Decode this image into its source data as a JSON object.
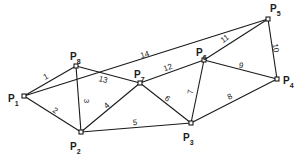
{
  "diagram": {
    "type": "network-graph",
    "nodes": [
      {
        "id": "P1",
        "letter": "P",
        "sub": "1",
        "x": 24,
        "y": 96,
        "lx": 8,
        "ly": 102
      },
      {
        "id": "P2",
        "letter": "P",
        "sub": "2",
        "x": 81,
        "y": 132,
        "lx": 70,
        "ly": 150
      },
      {
        "id": "P3",
        "letter": "P",
        "sub": "3",
        "x": 191,
        "y": 123,
        "lx": 183,
        "ly": 141
      },
      {
        "id": "P4",
        "letter": "P",
        "sub": "4",
        "x": 277,
        "y": 79,
        "lx": 283,
        "ly": 84
      },
      {
        "id": "P5",
        "letter": "P",
        "sub": "5",
        "x": 268,
        "y": 19,
        "lx": 270,
        "ly": 12
      },
      {
        "id": "P6",
        "letter": "P",
        "sub": "6",
        "x": 204,
        "y": 60,
        "lx": 196,
        "ly": 56
      },
      {
        "id": "P7",
        "letter": "P",
        "sub": "7",
        "x": 140,
        "y": 83,
        "lx": 134,
        "ly": 78
      },
      {
        "id": "P8",
        "letter": "P",
        "sub": "8",
        "x": 76,
        "y": 66,
        "lx": 70,
        "ly": 60
      }
    ],
    "edges": [
      {
        "label": "1",
        "from": "P1",
        "to": "P8",
        "lx": 46,
        "ly": 77,
        "rot": -28
      },
      {
        "label": "2",
        "from": "P1",
        "to": "P2",
        "lx": 55,
        "ly": 111,
        "rot": 32
      },
      {
        "label": "3",
        "from": "P8",
        "to": "P2",
        "lx": 86,
        "ly": 101,
        "rot": 90
      },
      {
        "label": "4",
        "from": "P2",
        "to": "P7",
        "lx": 107,
        "ly": 106,
        "rot": -42
      },
      {
        "label": "5",
        "from": "P2",
        "to": "P3",
        "lx": 135,
        "ly": 123,
        "rot": -4
      },
      {
        "label": "6",
        "from": "P7",
        "to": "P3",
        "lx": 167,
        "ly": 99,
        "rot": 38
      },
      {
        "label": "7",
        "from": "P6",
        "to": "P3",
        "lx": 191,
        "ly": 92,
        "rot": -80
      },
      {
        "label": "8",
        "from": "P3",
        "to": "P4",
        "lx": 230,
        "ly": 97,
        "rot": -27
      },
      {
        "label": "9",
        "from": "P6",
        "to": "P4",
        "lx": 241,
        "ly": 66,
        "rot": 14
      },
      {
        "label": "10",
        "from": "P5",
        "to": "P4",
        "lx": 275,
        "ly": 48,
        "rot": 82
      },
      {
        "label": "11",
        "from": "P6",
        "to": "P5",
        "lx": 225,
        "ly": 39,
        "rot": -36
      },
      {
        "label": "12",
        "from": "P7",
        "to": "P6",
        "lx": 168,
        "ly": 68,
        "rot": -20
      },
      {
        "label": "13",
        "from": "P8",
        "to": "P7",
        "lx": 103,
        "ly": 80,
        "rot": 14
      },
      {
        "label": "14",
        "from": "P1",
        "to": "P5",
        "lx": 145,
        "ly": 55,
        "rot": -17
      }
    ]
  }
}
